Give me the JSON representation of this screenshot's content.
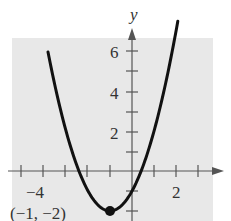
{
  "chart_data": {
    "type": "line",
    "title": "",
    "xlabel": "",
    "ylabel": "y",
    "function": "y = x^2 + 2x - 1",
    "x_ticks": [
      -5,
      -4,
      -3,
      -2,
      -1,
      0,
      1,
      2,
      3
    ],
    "x_tick_labels": [
      {
        "value": -4,
        "label": "−4"
      },
      {
        "value": 2,
        "label": "2"
      }
    ],
    "y_ticks": [
      -2,
      -1,
      1,
      2,
      3,
      4,
      5,
      6
    ],
    "y_tick_labels": [
      {
        "value": 2,
        "label": "2"
      },
      {
        "value": 4,
        "label": "4"
      },
      {
        "value": 6,
        "label": "6"
      }
    ],
    "xlim": [
      -5.5,
      3.7
    ],
    "ylim": [
      -2.5,
      6.6
    ],
    "grid": false,
    "series": [
      {
        "name": "parabola",
        "x": [
          -3.8,
          -3.5,
          -3,
          -2.5,
          -2,
          -1.5,
          -1,
          -0.5,
          0,
          0.5,
          1,
          1.5,
          2,
          2.1
        ],
        "values": [
          5.84,
          4.25,
          2,
          0.25,
          -1,
          -1.75,
          -2,
          -1.75,
          -1,
          0.25,
          2,
          4.25,
          7,
          7.61
        ]
      }
    ],
    "annotations": [
      {
        "type": "point",
        "x": -1,
        "y": -2,
        "label": "(−1, −2)"
      }
    ],
    "colors": {
      "background": "#e8e8e8",
      "curve": "#111111",
      "axis": "#555555"
    }
  },
  "labels": {
    "y_axis": "y",
    "tick_neg4": "−4",
    "tick_2": "2",
    "tick_y2": "2",
    "tick_y4": "4",
    "tick_y6": "6",
    "vertex": "(−1, −2)"
  }
}
